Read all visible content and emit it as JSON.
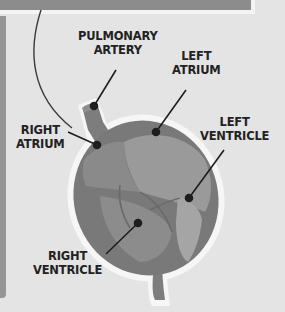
{
  "diagram": {
    "labels": {
      "pulmonary_artery": [
        "PULMONARY",
        "ARTERY"
      ],
      "left_atrium": [
        "LEFT",
        "ATRIUM"
      ],
      "right_atrium": [
        "RIGHT",
        "ATRIUM"
      ],
      "left_ventricle": [
        "LEFT",
        "VENTRICLE"
      ],
      "right_ventricle": [
        "RIGHT",
        "VENTRICLE"
      ]
    },
    "colors": {
      "background": "#e4e4e4",
      "top_band": "#8c8c8c",
      "heart_body": "#7a7a7a",
      "heart_light": "#9a9a9a",
      "outline": "#f4f4f4",
      "label_text": "#222222"
    }
  }
}
